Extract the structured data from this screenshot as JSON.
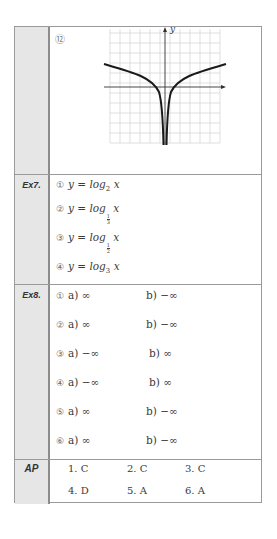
{
  "rows": [
    {
      "label": "",
      "item_number": "⑫",
      "graph": {
        "axis_label_y": "y",
        "description": "Graph of y = log|x| style curve, symmetric about the y-axis, with vertical asymptote at x = 0"
      }
    },
    {
      "label": "Ex7.",
      "items": [
        {
          "num": "①",
          "lhs": "y = log",
          "base": "2",
          "arg": "x"
        },
        {
          "num": "②",
          "lhs": "y = log",
          "base_frac": {
            "n": "1",
            "d": "3"
          },
          "arg": "x"
        },
        {
          "num": "③",
          "lhs": "y = log",
          "base_frac": {
            "n": "1",
            "d": "2"
          },
          "arg": "x"
        },
        {
          "num": "④",
          "lhs": "y = log",
          "base": "3",
          "arg": "x"
        }
      ]
    },
    {
      "label": "Ex8.",
      "items": [
        {
          "num": "①",
          "a": "a) ∞",
          "b": "b) −∞"
        },
        {
          "num": "②",
          "a": "a) ∞",
          "b": "b) −∞"
        },
        {
          "num": "③",
          "a": "a) −∞",
          "b": "b) ∞"
        },
        {
          "num": "④",
          "a": "a) −∞",
          "b": "b) ∞"
        },
        {
          "num": "⑤",
          "a": "a) ∞",
          "b": "b) −∞"
        },
        {
          "num": "⑥",
          "a": "a) ∞",
          "b": "b) −∞"
        }
      ]
    },
    {
      "label": "AP",
      "answers": [
        "1. C",
        "2. C",
        "3. C",
        "4. D",
        "5. A",
        "6. A"
      ]
    }
  ]
}
